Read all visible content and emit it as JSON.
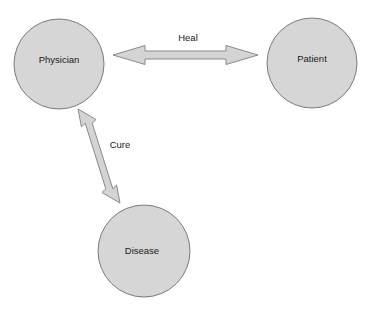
{
  "diagram": {
    "background_color": "#ffffff",
    "node_fill_color": "#d6d6d6",
    "node_stroke_color": "#7a7a7a",
    "arrow_fill_color": "#d4d4d4",
    "arrow_stroke_color": "#8a8a8a",
    "label_text_color": "#1a1a1a",
    "nodes": [
      {
        "id": "physician",
        "label": "Physician",
        "cx": 59,
        "cy": 64,
        "r": 45
      },
      {
        "id": "patient",
        "label": "Patient",
        "cx": 312,
        "cy": 63,
        "r": 45
      },
      {
        "id": "disease",
        "label": "Disease",
        "cx": 144,
        "cy": 251,
        "r": 46
      }
    ],
    "edges": [
      {
        "id": "heal",
        "label": "Heal",
        "from": "physician",
        "to": "patient",
        "direction": "bidirectional",
        "label_x": 188,
        "label_y": 38
      },
      {
        "id": "cure",
        "label": "Cure",
        "from": "physician",
        "to": "disease",
        "direction": "bidirectional",
        "label_x": 120,
        "label_y": 145
      }
    ]
  }
}
